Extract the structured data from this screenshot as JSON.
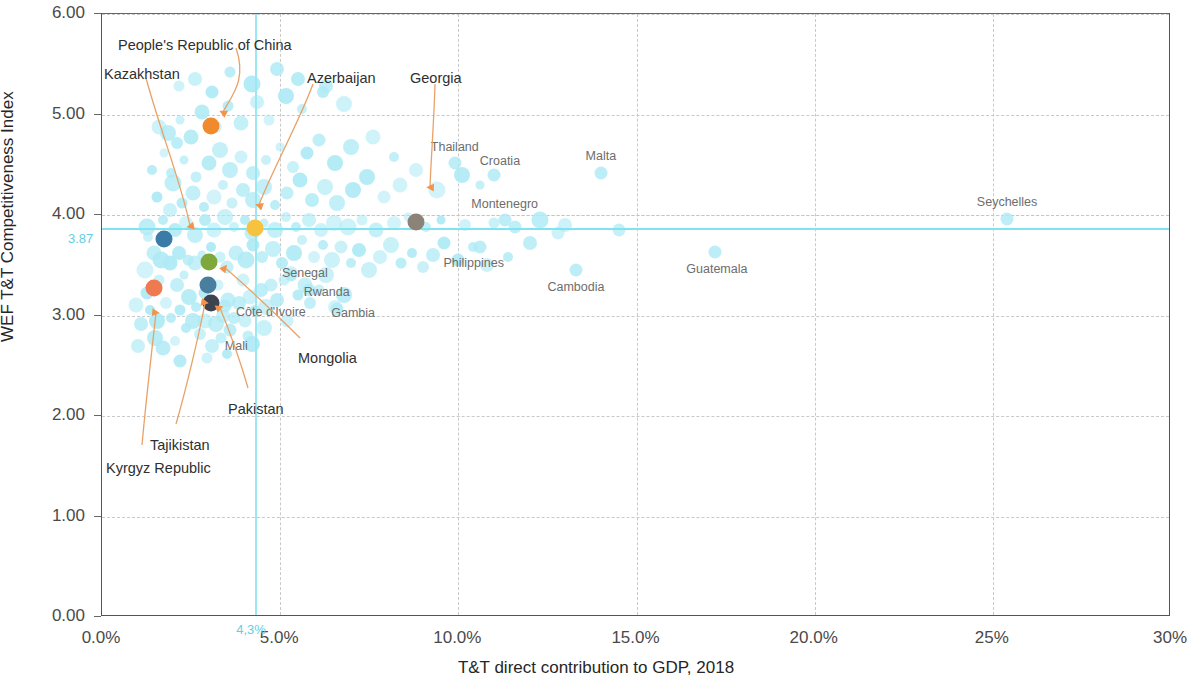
{
  "chart_data": {
    "type": "scatter",
    "title": "",
    "xlabel": "T&T direct contribution to GDP, 2018",
    "ylabel": "WEF T&T Competitiveness Index",
    "xlim": [
      0,
      30
    ],
    "ylim": [
      0,
      6
    ],
    "grid": true,
    "legend": "none",
    "x_ticks": [
      "0.0%",
      "5.0%",
      "10.0%",
      "15.0%",
      "20.0%",
      "25%",
      "30%"
    ],
    "x_tick_values": [
      0,
      5,
      10,
      15,
      20,
      25,
      30
    ],
    "y_ticks": [
      "0.00",
      "1.00",
      "2.00",
      "3.00",
      "4.00",
      "5.00",
      "6.00"
    ],
    "y_tick_values": [
      0,
      1,
      2,
      3,
      4,
      5,
      6
    ],
    "reference_lines": {
      "horizontal_highlight": {
        "label": "3.87",
        "value": 3.87,
        "color": "#7fe3f0"
      },
      "vertical_highlight": {
        "label": "4,3%",
        "value": 4.3,
        "color": "#9ce8f2"
      },
      "horizontal_dashed": {
        "value": 4.0,
        "color": "#e6b7b7"
      }
    },
    "highlighted": [
      {
        "name": "Kazakhstan",
        "x": 1.75,
        "y": 3.76,
        "color": "#3a7ca8"
      },
      {
        "name": "People's Republic of China",
        "x": 3.05,
        "y": 4.89,
        "color": "#f08a2c"
      },
      {
        "name": "Azerbaijan",
        "x": 4.3,
        "y": 3.87,
        "color": "#f7c23d"
      },
      {
        "name": "Georgia",
        "x": 8.8,
        "y": 3.93,
        "color": "#8b8378"
      },
      {
        "name": "Kyrgyz Republic",
        "x": 1.45,
        "y": 3.27,
        "color": "#f07a4f"
      },
      {
        "name": "Mongolia",
        "x": 3.0,
        "y": 3.53,
        "color": "#7fa83c"
      },
      {
        "name": "Tajikistan",
        "x": 2.98,
        "y": 3.3,
        "color": "#4a7e9e"
      },
      {
        "name": "Pakistan",
        "x": 3.05,
        "y": 3.12,
        "color": "#3d4450"
      }
    ],
    "named_points": [
      {
        "name": "Thailand",
        "x": 9.9,
        "y": 4.52
      },
      {
        "name": "Croatia",
        "x": 11.0,
        "y": 4.4
      },
      {
        "name": "Malta",
        "x": 14.0,
        "y": 4.42
      },
      {
        "name": "Montenegro",
        "x": 11.3,
        "y": 3.95
      },
      {
        "name": "Seychelles",
        "x": 25.4,
        "y": 3.96
      },
      {
        "name": "Philippines",
        "x": 10.6,
        "y": 3.68
      },
      {
        "name": "Cambodia",
        "x": 13.3,
        "y": 3.45
      },
      {
        "name": "Guatemala",
        "x": 17.2,
        "y": 3.63
      },
      {
        "name": "Senegal",
        "x": 5.3,
        "y": 3.4
      },
      {
        "name": "Rwanda",
        "x": 5.8,
        "y": 3.25
      },
      {
        "name": "Gambia",
        "x": 6.6,
        "y": 3.06
      },
      {
        "name": "Côte d'Ivoire",
        "x": 3.45,
        "y": 3.09
      },
      {
        "name": "Mali",
        "x": 3.6,
        "y": 2.86
      }
    ],
    "cloud_points": [
      [
        1.0,
        2.7
      ],
      [
        1.25,
        3.22
      ],
      [
        1.1,
        2.92
      ],
      [
        1.55,
        2.95
      ],
      [
        1.35,
        3.05
      ],
      [
        1.6,
        3.35
      ],
      [
        1.2,
        3.45
      ],
      [
        1.8,
        3.12
      ],
      [
        1.95,
        2.98
      ],
      [
        1.5,
        2.78
      ],
      [
        0.95,
        3.1
      ],
      [
        2.1,
        3.3
      ],
      [
        2.2,
        3.05
      ],
      [
        2.35,
        2.88
      ],
      [
        2.05,
        2.75
      ],
      [
        1.7,
        2.68
      ],
      [
        2.45,
        3.18
      ],
      [
        2.55,
        2.95
      ],
      [
        2.3,
        3.4
      ],
      [
        2.65,
        3.08
      ],
      [
        2.75,
        2.82
      ],
      [
        2.9,
        2.95
      ],
      [
        3.2,
        2.92
      ],
      [
        3.35,
        2.78
      ],
      [
        3.1,
        2.7
      ],
      [
        2.85,
        3.22
      ],
      [
        3.4,
        3.0
      ],
      [
        3.55,
        3.15
      ],
      [
        3.7,
        2.98
      ],
      [
        3.25,
        3.3
      ],
      [
        3.85,
        3.12
      ],
      [
        4.0,
        2.95
      ],
      [
        3.95,
        3.35
      ],
      [
        4.15,
        3.18
      ],
      [
        4.3,
        3.05
      ],
      [
        4.45,
        3.25
      ],
      [
        4.6,
        3.08
      ],
      [
        4.75,
        3.3
      ],
      [
        4.9,
        3.15
      ],
      [
        5.1,
        3.35
      ],
      [
        5.3,
        3.42
      ],
      [
        5.5,
        3.2
      ],
      [
        5.7,
        3.3
      ],
      [
        5.85,
        3.12
      ],
      [
        6.1,
        3.25
      ],
      [
        6.3,
        3.4
      ],
      [
        6.55,
        3.08
      ],
      [
        6.8,
        3.2
      ],
      [
        5.2,
        2.95
      ],
      [
        4.55,
        2.88
      ],
      [
        4.1,
        2.8
      ],
      [
        2.6,
        3.52
      ],
      [
        2.8,
        3.6
      ],
      [
        3.05,
        3.68
      ],
      [
        2.4,
        3.55
      ],
      [
        2.15,
        3.62
      ],
      [
        1.9,
        3.52
      ],
      [
        3.3,
        3.58
      ],
      [
        3.5,
        3.48
      ],
      [
        3.75,
        3.62
      ],
      [
        4.05,
        3.55
      ],
      [
        4.25,
        3.7
      ],
      [
        4.5,
        3.58
      ],
      [
        4.8,
        3.66
      ],
      [
        5.05,
        3.52
      ],
      [
        5.4,
        3.62
      ],
      [
        5.6,
        3.75
      ],
      [
        5.95,
        3.58
      ],
      [
        6.2,
        3.7
      ],
      [
        6.45,
        3.55
      ],
      [
        6.7,
        3.68
      ],
      [
        7.0,
        3.52
      ],
      [
        7.2,
        3.65
      ],
      [
        7.5,
        3.45
      ],
      [
        7.8,
        3.58
      ],
      [
        8.1,
        3.7
      ],
      [
        8.4,
        3.52
      ],
      [
        8.7,
        3.62
      ],
      [
        9.0,
        3.48
      ],
      [
        9.3,
        3.6
      ],
      [
        9.6,
        3.72
      ],
      [
        10.0,
        3.55
      ],
      [
        10.4,
        3.68
      ],
      [
        10.8,
        3.5
      ],
      [
        2.05,
        3.85
      ],
      [
        2.35,
        3.92
      ],
      [
        2.6,
        3.8
      ],
      [
        2.9,
        3.95
      ],
      [
        3.15,
        3.85
      ],
      [
        3.45,
        3.98
      ],
      [
        3.7,
        3.88
      ],
      [
        4.0,
        3.95
      ],
      [
        4.2,
        3.82
      ],
      [
        4.55,
        3.92
      ],
      [
        4.85,
        3.85
      ],
      [
        5.15,
        3.98
      ],
      [
        5.45,
        3.88
      ],
      [
        5.8,
        3.95
      ],
      [
        6.15,
        3.85
      ],
      [
        6.5,
        3.92
      ],
      [
        6.9,
        3.88
      ],
      [
        7.3,
        3.95
      ],
      [
        7.7,
        3.85
      ],
      [
        8.2,
        3.92
      ],
      [
        8.6,
        3.98
      ],
      [
        9.1,
        3.88
      ],
      [
        9.5,
        3.95
      ],
      [
        10.2,
        3.9
      ],
      [
        11.0,
        3.92
      ],
      [
        11.6,
        3.88
      ],
      [
        12.3,
        3.95
      ],
      [
        13.0,
        3.9
      ],
      [
        2.25,
        4.12
      ],
      [
        2.55,
        4.22
      ],
      [
        2.85,
        4.08
      ],
      [
        3.15,
        4.18
      ],
      [
        3.4,
        4.3
      ],
      [
        3.65,
        4.12
      ],
      [
        3.95,
        4.25
      ],
      [
        4.25,
        4.15
      ],
      [
        4.55,
        4.28
      ],
      [
        4.85,
        4.1
      ],
      [
        5.2,
        4.22
      ],
      [
        5.55,
        4.35
      ],
      [
        5.9,
        4.15
      ],
      [
        6.25,
        4.28
      ],
      [
        6.6,
        4.12
      ],
      [
        7.05,
        4.25
      ],
      [
        7.45,
        4.38
      ],
      [
        7.9,
        4.18
      ],
      [
        8.35,
        4.3
      ],
      [
        8.8,
        4.45
      ],
      [
        9.4,
        4.25
      ],
      [
        10.1,
        4.4
      ],
      [
        10.6,
        4.3
      ],
      [
        1.95,
        4.42
      ],
      [
        2.3,
        4.55
      ],
      [
        2.65,
        4.38
      ],
      [
        3.0,
        4.52
      ],
      [
        3.3,
        4.65
      ],
      [
        3.6,
        4.45
      ],
      [
        3.9,
        4.58
      ],
      [
        4.25,
        4.42
      ],
      [
        4.6,
        4.55
      ],
      [
        5.0,
        4.68
      ],
      [
        5.35,
        4.48
      ],
      [
        5.75,
        4.62
      ],
      [
        6.1,
        4.75
      ],
      [
        6.55,
        4.52
      ],
      [
        7.0,
        4.68
      ],
      [
        7.6,
        4.78
      ],
      [
        8.2,
        4.58
      ],
      [
        1.85,
        4.82
      ],
      [
        2.2,
        4.95
      ],
      [
        2.5,
        4.78
      ],
      [
        2.8,
        5.02
      ],
      [
        3.2,
        4.88
      ],
      [
        3.55,
        5.08
      ],
      [
        3.9,
        4.92
      ],
      [
        4.35,
        5.12
      ],
      [
        4.7,
        4.95
      ],
      [
        5.15,
        5.18
      ],
      [
        5.6,
        5.05
      ],
      [
        6.2,
        5.22
      ],
      [
        6.8,
        5.1
      ],
      [
        2.15,
        5.28
      ],
      [
        2.6,
        5.35
      ],
      [
        3.1,
        5.22
      ],
      [
        3.6,
        5.42
      ],
      [
        4.2,
        5.3
      ],
      [
        4.9,
        5.45
      ],
      [
        5.5,
        5.35
      ],
      [
        6.3,
        5.28
      ],
      [
        1.45,
        3.62
      ],
      [
        1.3,
        3.78
      ],
      [
        1.65,
        3.55
      ],
      [
        1.25,
        3.88
      ],
      [
        1.7,
        3.95
      ],
      [
        1.55,
        4.18
      ],
      [
        1.9,
        4.05
      ],
      [
        2.0,
        4.32
      ],
      [
        1.4,
        4.45
      ],
      [
        1.75,
        4.62
      ],
      [
        2.1,
        4.72
      ],
      [
        1.6,
        4.88
      ],
      [
        12.0,
        3.72
      ],
      [
        12.8,
        3.82
      ],
      [
        14.5,
        3.85
      ],
      [
        11.4,
        3.58
      ],
      [
        2.95,
        2.58
      ],
      [
        3.5,
        2.62
      ],
      [
        2.2,
        2.55
      ],
      [
        4.2,
        2.72
      ]
    ]
  },
  "callouts": [
    {
      "label": "People's Republic of China",
      "text_x": 118,
      "text_y": 37
    },
    {
      "label": "Kazakhstan",
      "text_x": 104,
      "text_y": 66
    },
    {
      "label": "Azerbaijan",
      "text_x": 307,
      "text_y": 70
    },
    {
      "label": "Georgia",
      "text_x": 410,
      "text_y": 70
    },
    {
      "label": "Mongolia",
      "text_x": 298,
      "text_y": 350
    },
    {
      "label": "Pakistan",
      "text_x": 228,
      "text_y": 401
    },
    {
      "label": "Tajikistan",
      "text_x": 150,
      "text_y": 437
    },
    {
      "label": "Kyrgyz Republic",
      "text_x": 106,
      "text_y": 460
    }
  ]
}
